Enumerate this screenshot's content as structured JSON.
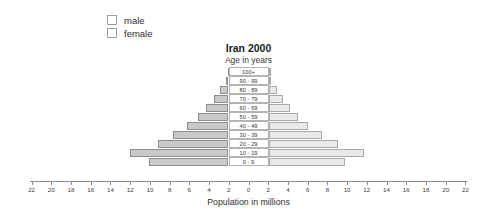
{
  "legend": {
    "items": [
      {
        "label": "male",
        "color": "#c9c9c9"
      },
      {
        "label": "female",
        "color": "#e9e9e9"
      }
    ]
  },
  "axis_title": "Population in millions",
  "chart_data": {
    "type": "bar",
    "subtype": "population-pyramid",
    "title": "Iran 2000",
    "subtitle": "Age in years",
    "xlabel": "Population in millions",
    "ylabel": "Age in years",
    "grid": false,
    "legend_position": "top-left",
    "xlim": [
      -22,
      22
    ],
    "xticks": [
      22,
      20,
      18,
      16,
      14,
      12,
      10,
      8,
      6,
      4,
      2,
      0,
      2,
      4,
      6,
      8,
      10,
      12,
      14,
      16,
      18,
      20,
      22
    ],
    "categories": [
      "100+",
      "90 - 99",
      "80 - 89",
      "70 - 79",
      "60 - 69",
      "50 - 59",
      "40 - 49",
      "30 - 39",
      "20 - 29",
      "10 - 19",
      "0 - 9"
    ],
    "series": [
      {
        "name": "male",
        "direction": "left",
        "color": "#c9c9c9",
        "values": [
          0.05,
          0.3,
          0.9,
          1.5,
          2.3,
          3.1,
          4.2,
          5.6,
          7.2,
          10.0,
          8.1
        ]
      },
      {
        "name": "female",
        "direction": "right",
        "color": "#e9e9e9",
        "values": [
          0.05,
          0.3,
          0.9,
          1.5,
          2.2,
          3.0,
          4.0,
          5.4,
          7.0,
          9.7,
          7.8
        ]
      }
    ]
  }
}
